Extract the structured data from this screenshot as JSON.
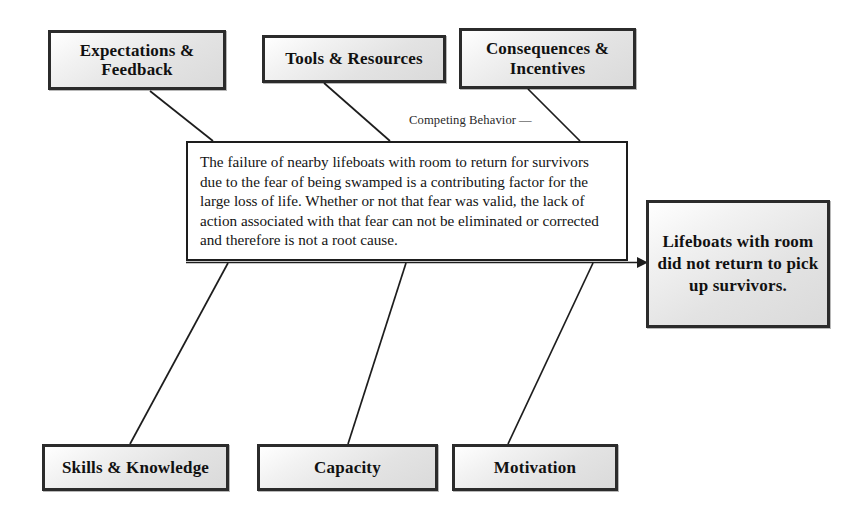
{
  "diagram": {
    "type": "fishbone-cause-and-effect",
    "title_annotation": "Competing Behavior",
    "annotation_dash": "—",
    "effect": {
      "label": "Lifeboats with room did not return to pick up survivors."
    },
    "narrative": {
      "text": "The failure of nearby lifeboats with room to return for survivors due to the fear of being swamped is a contributing factor for the large loss of life. Whether or not that fear was valid, the lack of action associated with that fear can not be eliminated or corrected and therefore is not a root cause."
    },
    "causes_top": [
      {
        "label": "Expectations & Feedback"
      },
      {
        "label": "Tools & Resources"
      },
      {
        "label": "Consequences & Incentives"
      }
    ],
    "causes_bottom": [
      {
        "label": "Skills & Knowledge"
      },
      {
        "label": "Capacity"
      },
      {
        "label": "Motivation"
      }
    ],
    "colors": {
      "box_border": "#2b2b2b",
      "box_fill": "#e6e6e6",
      "line": "#1d1d1d",
      "text": "#111111",
      "background": "#ffffff"
    }
  }
}
